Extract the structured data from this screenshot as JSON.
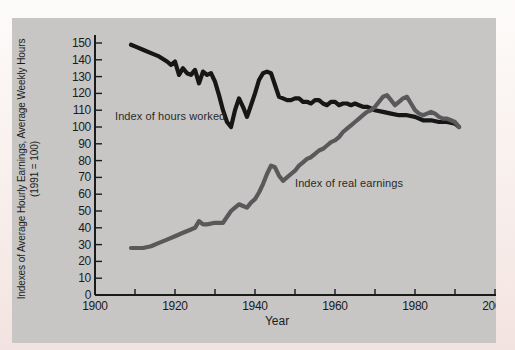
{
  "figure": {
    "page_background": "#f8efec",
    "panel_background": "#c7c6c4",
    "axis_color": "#1a1a1a",
    "text_color": "#1c1c1c"
  },
  "chart_data": {
    "type": "line",
    "title": "",
    "xlabel": "Year",
    "ylabel_line1": "Indexes of Average Hourly Earnings, Average Weekly Hours",
    "ylabel_line2": "(1991 = 100)",
    "xlim": [
      1900,
      2000
    ],
    "ylim": [
      0,
      150
    ],
    "grid": false,
    "legend_position": "inline-annotations",
    "y_ticks": [
      0,
      10,
      20,
      30,
      40,
      50,
      60,
      70,
      80,
      90,
      100,
      110,
      120,
      130,
      140,
      150
    ],
    "x_minor_ticks": [
      1910,
      1920,
      1930,
      1940,
      1950,
      1960,
      1970,
      1980,
      1990,
      2000
    ],
    "x_tick_labels": [
      1900,
      1920,
      1940,
      1960,
      1980,
      2000
    ],
    "series": [
      {
        "name": "Index of hours worked",
        "color": "#161616",
        "points": [
          [
            1909,
            149
          ],
          [
            1910,
            148
          ],
          [
            1912,
            146
          ],
          [
            1914,
            144
          ],
          [
            1916,
            142
          ],
          [
            1918,
            139
          ],
          [
            1919,
            137
          ],
          [
            1920,
            139
          ],
          [
            1921,
            131
          ],
          [
            1922,
            135
          ],
          [
            1923,
            132
          ],
          [
            1924,
            131
          ],
          [
            1925,
            134
          ],
          [
            1926,
            126
          ],
          [
            1927,
            133
          ],
          [
            1928,
            131
          ],
          [
            1929,
            132
          ],
          [
            1930,
            127
          ],
          [
            1931,
            119
          ],
          [
            1932,
            110
          ],
          [
            1933,
            103
          ],
          [
            1934,
            100
          ],
          [
            1935,
            110
          ],
          [
            1936,
            117
          ],
          [
            1937,
            112
          ],
          [
            1938,
            106
          ],
          [
            1939,
            113
          ],
          [
            1940,
            120
          ],
          [
            1941,
            128
          ],
          [
            1942,
            132
          ],
          [
            1943,
            133
          ],
          [
            1944,
            132
          ],
          [
            1945,
            125
          ],
          [
            1946,
            118
          ],
          [
            1947,
            117
          ],
          [
            1948,
            116
          ],
          [
            1949,
            116
          ],
          [
            1950,
            117
          ],
          [
            1951,
            117
          ],
          [
            1952,
            115
          ],
          [
            1953,
            115
          ],
          [
            1954,
            114
          ],
          [
            1955,
            116
          ],
          [
            1956,
            116
          ],
          [
            1957,
            114
          ],
          [
            1958,
            113
          ],
          [
            1959,
            115
          ],
          [
            1960,
            115
          ],
          [
            1961,
            113
          ],
          [
            1962,
            114
          ],
          [
            1963,
            114
          ],
          [
            1964,
            113
          ],
          [
            1965,
            114
          ],
          [
            1966,
            113
          ],
          [
            1967,
            112
          ],
          [
            1968,
            112
          ],
          [
            1969,
            111
          ],
          [
            1970,
            110
          ],
          [
            1972,
            109
          ],
          [
            1974,
            108
          ],
          [
            1976,
            107
          ],
          [
            1978,
            107
          ],
          [
            1980,
            106
          ],
          [
            1982,
            104
          ],
          [
            1984,
            104
          ],
          [
            1986,
            103
          ],
          [
            1988,
            103
          ],
          [
            1990,
            102
          ],
          [
            1991,
            100
          ]
        ]
      },
      {
        "name": "Index of real earnings",
        "color": "#59595b",
        "points": [
          [
            1909,
            28
          ],
          [
            1910,
            28
          ],
          [
            1912,
            28
          ],
          [
            1914,
            29
          ],
          [
            1916,
            31
          ],
          [
            1918,
            33
          ],
          [
            1920,
            35
          ],
          [
            1922,
            37
          ],
          [
            1924,
            39
          ],
          [
            1925,
            40
          ],
          [
            1926,
            44
          ],
          [
            1927,
            42
          ],
          [
            1928,
            42
          ],
          [
            1930,
            43
          ],
          [
            1932,
            43
          ],
          [
            1934,
            50
          ],
          [
            1935,
            52
          ],
          [
            1936,
            54
          ],
          [
            1937,
            53
          ],
          [
            1938,
            52
          ],
          [
            1939,
            55
          ],
          [
            1940,
            57
          ],
          [
            1941,
            61
          ],
          [
            1942,
            66
          ],
          [
            1943,
            72
          ],
          [
            1944,
            77
          ],
          [
            1945,
            76
          ],
          [
            1946,
            71
          ],
          [
            1947,
            68
          ],
          [
            1948,
            70
          ],
          [
            1949,
            72
          ],
          [
            1950,
            74
          ],
          [
            1951,
            77
          ],
          [
            1952,
            79
          ],
          [
            1953,
            81
          ],
          [
            1954,
            82
          ],
          [
            1955,
            84
          ],
          [
            1956,
            86
          ],
          [
            1957,
            87
          ],
          [
            1958,
            89
          ],
          [
            1959,
            91
          ],
          [
            1960,
            92
          ],
          [
            1961,
            94
          ],
          [
            1962,
            97
          ],
          [
            1963,
            99
          ],
          [
            1964,
            101
          ],
          [
            1965,
            103
          ],
          [
            1966,
            105
          ],
          [
            1967,
            107
          ],
          [
            1968,
            109
          ],
          [
            1969,
            110
          ],
          [
            1970,
            112
          ],
          [
            1971,
            115
          ],
          [
            1972,
            118
          ],
          [
            1973,
            119
          ],
          [
            1974,
            116
          ],
          [
            1975,
            113
          ],
          [
            1976,
            115
          ],
          [
            1977,
            117
          ],
          [
            1978,
            118
          ],
          [
            1979,
            114
          ],
          [
            1980,
            110
          ],
          [
            1981,
            108
          ],
          [
            1982,
            107
          ],
          [
            1983,
            108
          ],
          [
            1984,
            109
          ],
          [
            1985,
            108
          ],
          [
            1986,
            106
          ],
          [
            1987,
            105
          ],
          [
            1988,
            105
          ],
          [
            1989,
            104
          ],
          [
            1990,
            103
          ],
          [
            1991,
            100
          ]
        ]
      }
    ],
    "annotations": [
      {
        "text": "Index of hours worked",
        "x": 1905,
        "y": 110
      },
      {
        "text": "Index of real earnings",
        "x": 1950,
        "y": 70
      }
    ]
  }
}
